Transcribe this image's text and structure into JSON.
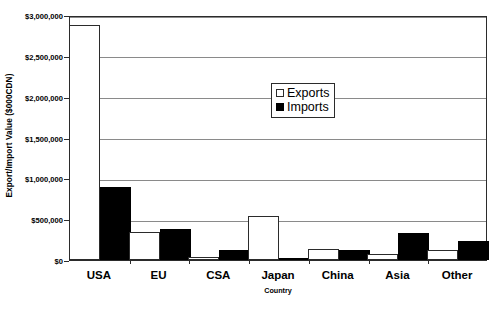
{
  "chart_data": {
    "type": "bar",
    "title": "",
    "xlabel": "Country",
    "ylabel": "Export/Import Value ($000CDN)",
    "categories": [
      "USA",
      "EU",
      "CSA",
      "Japan",
      "China",
      "Asia",
      "Other"
    ],
    "series": [
      {
        "name": "Exports",
        "color": "#ffffff",
        "values": [
          2880000,
          345000,
          40000,
          535000,
          130000,
          70000,
          125000
        ]
      },
      {
        "name": "Imports",
        "color": "#000000",
        "values": [
          895000,
          380000,
          125000,
          25000,
          120000,
          330000,
          235000
        ]
      }
    ],
    "ylim": [
      0,
      3000000
    ],
    "ytick_values": [
      0,
      500000,
      1000000,
      1500000,
      2000000,
      2500000,
      3000000
    ],
    "ytick_labels": [
      "$0",
      "$500,000",
      "$1,000,000",
      "$1,500,000",
      "$2,000,000",
      "$2,500,000",
      "$3,000,000"
    ],
    "grid": true,
    "legend_position": "upper-center",
    "legend_entries": [
      "Exports",
      "Imports"
    ]
  },
  "axis": {
    "y_title": "Export/Import Value ($000CDN)",
    "x_title": "Country"
  },
  "legend": {
    "exports_label": "Exports",
    "imports_label": "Imports"
  }
}
